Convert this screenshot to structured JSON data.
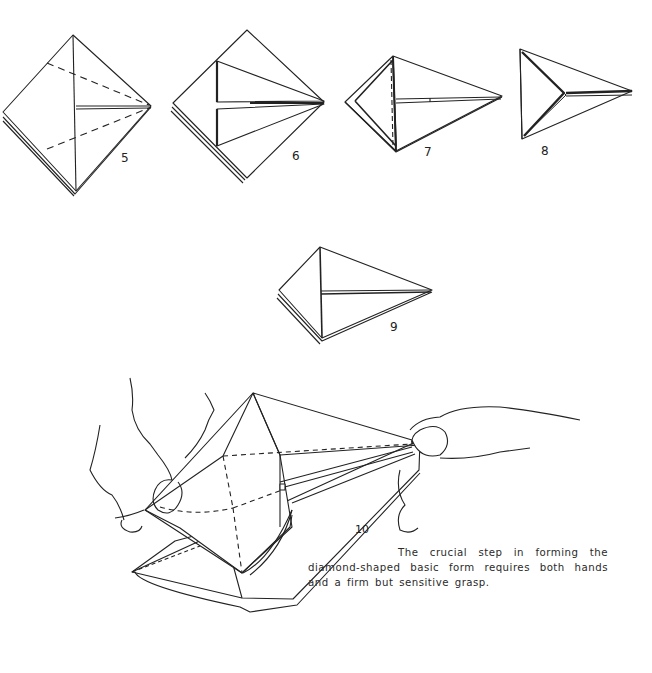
{
  "figures": [
    {
      "step": "5"
    },
    {
      "step": "6"
    },
    {
      "step": "7"
    },
    {
      "step": "8"
    },
    {
      "step": "9"
    },
    {
      "step": "10"
    }
  ],
  "caption": {
    "text": "The crucial step in forming the diamond-shaped basic form requires both hands and a firm but sensitive grasp."
  },
  "colors": {
    "ink": "#222222",
    "paper": "#ffffff"
  }
}
